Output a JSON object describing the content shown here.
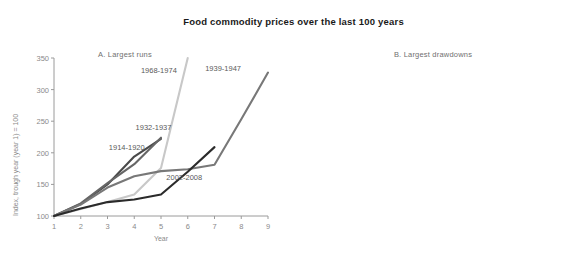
{
  "title": "Food commodity prices over the last 100 years",
  "chart_data": [
    {
      "type": "line",
      "panel_id": "A",
      "title": "A. Largest runs",
      "xlabel": "Year",
      "ylabel": "Index, trough year (year 1) = 100",
      "xlim": [
        1,
        9
      ],
      "ylim": [
        100,
        350
      ],
      "xticks": [
        1,
        2,
        3,
        4,
        5,
        6,
        7,
        8,
        9
      ],
      "yticks": [
        100,
        150,
        200,
        250,
        300,
        350
      ],
      "grid": false,
      "legend_position": "inline-annotations",
      "series": [
        {
          "name": "1914-1920",
          "color": "#4a4a4a",
          "x": [
            1,
            2,
            3,
            4,
            5
          ],
          "values": [
            100,
            119,
            150,
            194,
            222
          ],
          "label_x": 3.05,
          "label_y": 207
        },
        {
          "name": "1932-1937",
          "color": "#666666",
          "x": [
            1,
            2,
            3,
            4,
            5
          ],
          "values": [
            100,
            120,
            152,
            182,
            224
          ],
          "label_x": 4.05,
          "label_y": 240
        },
        {
          "name": "1968-1974",
          "color": "#c8c8c8",
          "x": [
            1,
            2,
            3,
            4,
            5,
            6
          ],
          "values": [
            100,
            111,
            122,
            134,
            176,
            350
          ],
          "label_x": 4.25,
          "label_y": 330
        },
        {
          "name": "1939-1947",
          "color": "#787878",
          "x": [
            1,
            2,
            3,
            4,
            5,
            6,
            7,
            8,
            9
          ],
          "values": [
            100,
            118,
            145,
            163,
            171,
            174,
            181,
            253,
            327
          ],
          "label_x": 6.65,
          "label_y": 333
        },
        {
          "name": "2002-2008",
          "color": "#2b2b2b",
          "x": [
            1,
            2,
            3,
            4,
            5,
            6,
            7
          ],
          "values": [
            100,
            112,
            122,
            126,
            134,
            170,
            209
          ],
          "label_x": 5.2,
          "label_y": 160
        }
      ]
    },
    {
      "type": "line",
      "panel_id": "B",
      "title": "B. Largest drawdowns",
      "xlabel": "Year",
      "ylabel": "Index, peak year (year 1) = 100",
      "xlim": [
        1,
        7
      ],
      "ylim": [
        40,
        100
      ],
      "xticks": [
        1,
        2,
        3,
        4,
        5,
        6,
        7
      ],
      "yticks": [
        40,
        50,
        60,
        70,
        80,
        90,
        100
      ],
      "grid": false,
      "legend_position": "inline-annotations",
      "series": [
        {
          "name": "1981-1987",
          "color": "#c8c8c8",
          "x": [
            1,
            2,
            3,
            4,
            5,
            6,
            7
          ],
          "values": [
            100,
            77,
            81,
            83,
            72,
            70,
            66
          ],
          "label_x": 5.15,
          "label_y": 72.5
        },
        {
          "name": "1937-1939",
          "color": "#767676",
          "x": [
            1,
            2,
            3
          ],
          "values": [
            100,
            75,
            65
          ],
          "label_x": 3.15,
          "label_y": 63.5
        },
        {
          "name": "1920-1926",
          "color": "#2b2b2b",
          "x": [
            1,
            2,
            3,
            4,
            5,
            6,
            7
          ],
          "values": [
            100,
            46,
            45,
            53.5,
            55,
            56.5,
            51.5
          ],
          "label_x": 4.95,
          "label_y": 60.5
        },
        {
          "name": "1929-1932",
          "color": "#4a4a4a",
          "x": [
            1,
            2,
            3,
            4
          ],
          "values": [
            100,
            72,
            55,
            42.5
          ],
          "label_x": 4.1,
          "label_y": 43.5
        }
      ]
    }
  ]
}
